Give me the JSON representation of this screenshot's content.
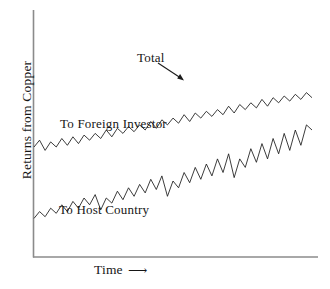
{
  "chart_data": {
    "type": "line",
    "title": "",
    "subtitle": "",
    "xlabel": "Time",
    "ylabel": "Returns from Copper",
    "xlabel_arrow": "⟶",
    "grid": false,
    "legend_position": "inline-annotations",
    "axes": {
      "x_ticks": [],
      "y_ticks": [],
      "xlim": [
        0,
        100
      ],
      "ylim": [
        0,
        100
      ],
      "note": "Schematic chart: axes are unlabeled and unscaled"
    },
    "annotations": [
      {
        "name": "total-annotation",
        "text": "Total",
        "points_to": "total-series",
        "arrow": true
      },
      {
        "name": "foreign-investor-annotation",
        "text": "To Foreign Investor",
        "points_to": "total-series",
        "arrow": false
      },
      {
        "name": "host-country-annotation",
        "text": "To Host Country",
        "points_to": "host-country-series",
        "arrow": false
      }
    ],
    "series": [
      {
        "name": "Total",
        "style": "sawtooth-oscillating",
        "color": "#1a1a1a",
        "description": "Upper curve: gently rising jagged line representing total returns from copper, starting moderate and trending up across time.",
        "x": [
          0,
          2,
          4,
          6,
          8,
          10,
          12,
          14,
          16,
          18,
          20,
          22,
          24,
          26,
          28,
          30,
          32,
          34,
          36,
          38,
          40,
          42,
          44,
          46,
          48,
          50,
          52,
          54,
          56,
          58,
          60,
          62,
          64,
          66,
          68,
          70,
          72,
          74,
          76,
          78,
          80,
          82,
          84,
          86,
          88,
          90,
          92,
          94,
          96,
          98,
          100
        ],
        "y": [
          50,
          54,
          48,
          53,
          50,
          55,
          51,
          56,
          52,
          57,
          54,
          58,
          55,
          60,
          56,
          61,
          58,
          62,
          59,
          63,
          60,
          65,
          61,
          66,
          63,
          67,
          64,
          69,
          65,
          70,
          67,
          71,
          68,
          72,
          69,
          74,
          70,
          75,
          72,
          76,
          73,
          78,
          74,
          79,
          76,
          80,
          77,
          81,
          78,
          82,
          79
        ]
      },
      {
        "name": "To Host Country",
        "style": "sawtooth-with-resets",
        "color": "#1a1a1a",
        "description": "Lower curve: steeply rising jagged line with periodic sharp vertical drops, representing returns accruing to the host country.",
        "x": [
          0,
          2,
          4,
          6,
          8,
          10,
          12,
          14,
          16,
          18,
          20,
          22,
          24,
          26,
          28,
          30,
          32,
          34,
          36,
          38,
          40,
          42,
          44,
          46,
          48,
          50,
          52,
          54,
          56,
          58,
          60,
          62,
          64,
          66,
          68,
          70,
          72,
          74,
          76,
          78,
          80,
          82,
          84,
          86,
          88,
          90,
          92,
          94,
          96,
          98,
          100
        ],
        "y": [
          8,
          12,
          9,
          14,
          11,
          16,
          12,
          18,
          14,
          20,
          16,
          22,
          13,
          20,
          17,
          24,
          19,
          26,
          21,
          28,
          23,
          31,
          25,
          33,
          21,
          30,
          26,
          35,
          29,
          38,
          31,
          40,
          33,
          43,
          35,
          46,
          32,
          43,
          38,
          49,
          41,
          52,
          43,
          55,
          46,
          58,
          48,
          60,
          51,
          63,
          60
        ]
      }
    ]
  },
  "labels": {
    "ylabel": "Returns from Copper",
    "xlabel": "Time",
    "xlabel_arrow": "⟶",
    "total": "Total",
    "foreign_investor": "To Foreign Investor",
    "host_country": "To Host Country"
  },
  "colors": {
    "line": "#1a1a1a",
    "axis": "#8b8b8b",
    "background": "#ffffff",
    "text": "#161616"
  }
}
